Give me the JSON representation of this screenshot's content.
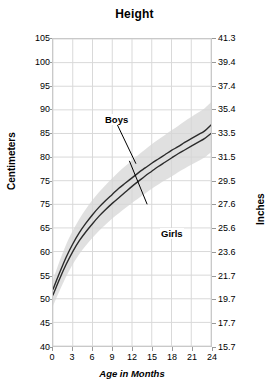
{
  "chart": {
    "title": "Height",
    "xlabel": "Age in Months",
    "ylabel_left": "Centimeters",
    "ylabel_right": "Inches"
  },
  "annotations": {
    "boys": "Boys",
    "girls": "Girls"
  },
  "colors": {
    "line": "#2b2b2b",
    "band": "#d5d5d5",
    "grid": "#d9d9d9",
    "frame": "#c9c9c9",
    "background": "#ffffff",
    "text": "#000000"
  },
  "chart_data": {
    "type": "line",
    "title": "Height",
    "xlabel": "Age in Months",
    "ylabel": "Centimeters",
    "ylabel_secondary": "Inches",
    "xlim": [
      0,
      24
    ],
    "ylim": [
      40,
      105
    ],
    "ylim_secondary": [
      15.7,
      41.3
    ],
    "grid": true,
    "legend": "inline-annotations",
    "xticks": [
      0,
      3,
      6,
      9,
      12,
      15,
      18,
      21,
      24
    ],
    "xticklabels": [
      "0",
      "3",
      "6",
      "9",
      "12",
      "15",
      "18",
      "21",
      "24"
    ],
    "yticks_left": [
      105,
      100,
      95,
      90,
      85,
      80,
      75,
      70,
      65,
      60,
      55,
      50,
      45,
      40
    ],
    "yticklabels_left": [
      "105",
      "100",
      "95",
      "90",
      "85",
      "80",
      "75",
      "75",
      "65",
      "60",
      "55",
      "50",
      "45",
      "40"
    ],
    "yticks_right_values": [
      41.3,
      39.4,
      37.4,
      35.4,
      33.5,
      31.5,
      29.5,
      27.6,
      25.6,
      23.6,
      21.7,
      19.7,
      17.7,
      15.7
    ],
    "yticklabels_right": [
      "41.3",
      "39.4",
      "37.4",
      "35.4",
      "33.5",
      "31.5",
      "29.5",
      "27.6",
      "25.6",
      "23.6",
      "21.7",
      "19.7",
      "17.7",
      "15.7"
    ],
    "x": [
      0,
      1,
      2,
      3,
      4,
      5,
      6,
      7,
      8,
      9,
      10,
      11,
      12,
      13,
      14,
      15,
      16,
      17,
      18,
      19,
      20,
      21,
      22,
      23,
      24
    ],
    "series": [
      {
        "name": "Boys",
        "values": [
          52.0,
          55.5,
          58.8,
          61.6,
          64.0,
          66.0,
          67.8,
          69.4,
          70.8,
          72.1,
          73.4,
          74.5,
          75.6,
          76.7,
          77.7,
          78.7,
          79.6,
          80.5,
          81.4,
          82.2,
          83.1,
          83.9,
          84.7,
          85.5,
          86.8
        ]
      },
      {
        "name": "Girls",
        "values": [
          50.8,
          54.2,
          57.3,
          60.0,
          62.3,
          64.2,
          65.9,
          67.5,
          68.9,
          70.2,
          71.4,
          72.6,
          73.8,
          74.9,
          76.0,
          77.0,
          78.0,
          78.9,
          79.8,
          80.7,
          81.5,
          82.3,
          83.1,
          83.9,
          85.0
        ]
      }
    ],
    "band": {
      "label": "percentile range",
      "upper": [
        54.0,
        58.0,
        61.5,
        64.4,
        66.9,
        69.0,
        70.9,
        72.6,
        74.1,
        75.5,
        76.9,
        78.1,
        79.3,
        80.5,
        81.6,
        82.7,
        83.7,
        84.7,
        85.7,
        86.6,
        87.6,
        88.5,
        89.4,
        90.3,
        91.6
      ],
      "lower": [
        48.5,
        51.7,
        54.7,
        57.3,
        59.5,
        61.3,
        62.9,
        64.4,
        65.7,
        67.0,
        68.1,
        69.2,
        70.3,
        71.3,
        72.3,
        73.3,
        74.2,
        75.1,
        75.9,
        76.8,
        77.6,
        78.4,
        79.1,
        79.9,
        81.0
      ]
    }
  }
}
